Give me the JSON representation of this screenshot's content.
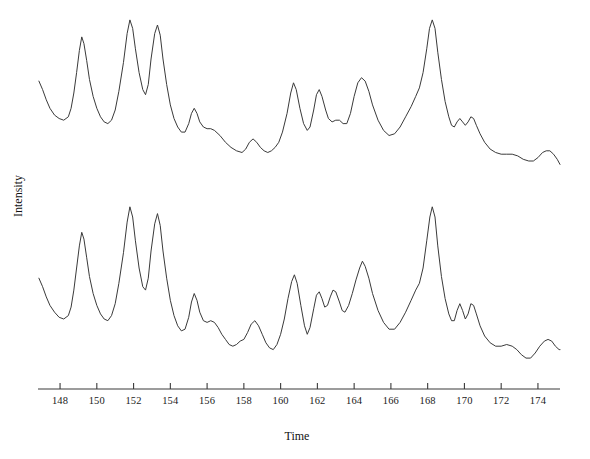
{
  "chart_data": {
    "type": "line",
    "title": "",
    "subtitle": "",
    "xlabel": "Time",
    "ylabel": "Intensity",
    "xlim": [
      146.8,
      175.2
    ],
    "ylim": [
      0,
      100
    ],
    "grid": false,
    "legend": "none",
    "x_ticks": [
      148,
      150,
      152,
      154,
      156,
      158,
      160,
      162,
      164,
      166,
      168,
      170,
      172,
      174
    ],
    "x_tick_labels": [
      "148",
      "150",
      "152",
      "154",
      "156",
      "158",
      "160",
      "162",
      "164",
      "166",
      "168",
      "170",
      "172",
      "174"
    ],
    "y_ticks": [],
    "y_tick_labels": [],
    "annotations": [],
    "series": [
      {
        "name": "upper-trace",
        "offset_label": "upper",
        "points": [
          [
            146.85,
            57
          ],
          [
            147.05,
            52
          ],
          [
            147.25,
            46
          ],
          [
            147.45,
            41
          ],
          [
            147.7,
            37
          ],
          [
            147.95,
            35
          ],
          [
            148.2,
            34
          ],
          [
            148.45,
            36
          ],
          [
            148.6,
            41
          ],
          [
            148.75,
            50
          ],
          [
            148.9,
            62
          ],
          [
            149.05,
            75
          ],
          [
            149.18,
            83
          ],
          [
            149.3,
            79
          ],
          [
            149.45,
            69
          ],
          [
            149.6,
            58
          ],
          [
            149.8,
            48
          ],
          [
            150.0,
            41
          ],
          [
            150.2,
            36
          ],
          [
            150.4,
            33
          ],
          [
            150.6,
            32
          ],
          [
            150.8,
            34
          ],
          [
            151.0,
            40
          ],
          [
            151.2,
            51
          ],
          [
            151.45,
            68
          ],
          [
            151.65,
            85
          ],
          [
            151.8,
            93
          ],
          [
            151.95,
            88
          ],
          [
            152.1,
            76
          ],
          [
            152.3,
            62
          ],
          [
            152.5,
            52
          ],
          [
            152.65,
            49
          ],
          [
            152.8,
            55
          ],
          [
            152.95,
            70
          ],
          [
            153.15,
            85
          ],
          [
            153.3,
            90
          ],
          [
            153.45,
            84
          ],
          [
            153.6,
            70
          ],
          [
            153.8,
            55
          ],
          [
            154.0,
            43
          ],
          [
            154.2,
            35
          ],
          [
            154.4,
            30
          ],
          [
            154.6,
            27
          ],
          [
            154.8,
            27
          ],
          [
            155.0,
            32
          ],
          [
            155.15,
            38
          ],
          [
            155.3,
            41
          ],
          [
            155.45,
            38
          ],
          [
            155.6,
            33
          ],
          [
            155.8,
            30
          ],
          [
            156.0,
            29
          ],
          [
            156.2,
            29
          ],
          [
            156.4,
            28
          ],
          [
            156.7,
            25
          ],
          [
            157.0,
            21
          ],
          [
            157.3,
            18
          ],
          [
            157.6,
            16
          ],
          [
            157.9,
            15
          ],
          [
            158.1,
            17
          ],
          [
            158.3,
            21
          ],
          [
            158.5,
            23
          ],
          [
            158.7,
            21
          ],
          [
            158.9,
            18
          ],
          [
            159.1,
            16
          ],
          [
            159.3,
            15
          ],
          [
            159.5,
            16
          ],
          [
            159.7,
            18
          ],
          [
            159.9,
            21
          ],
          [
            160.1,
            27
          ],
          [
            160.35,
            38
          ],
          [
            160.55,
            50
          ],
          [
            160.7,
            56
          ],
          [
            160.85,
            52
          ],
          [
            161.05,
            41
          ],
          [
            161.25,
            32
          ],
          [
            161.45,
            28
          ],
          [
            161.6,
            30
          ],
          [
            161.8,
            40
          ],
          [
            161.95,
            49
          ],
          [
            162.1,
            52
          ],
          [
            162.25,
            48
          ],
          [
            162.45,
            40
          ],
          [
            162.6,
            35
          ],
          [
            162.8,
            33
          ],
          [
            163.0,
            34
          ],
          [
            163.2,
            34
          ],
          [
            163.4,
            32
          ],
          [
            163.6,
            32
          ],
          [
            163.8,
            38
          ],
          [
            164.0,
            48
          ],
          [
            164.2,
            56
          ],
          [
            164.4,
            59
          ],
          [
            164.6,
            57
          ],
          [
            164.8,
            51
          ],
          [
            165.0,
            43
          ],
          [
            165.3,
            34
          ],
          [
            165.6,
            28
          ],
          [
            165.9,
            25
          ],
          [
            166.2,
            26
          ],
          [
            166.5,
            30
          ],
          [
            166.8,
            36
          ],
          [
            167.1,
            42
          ],
          [
            167.35,
            48
          ],
          [
            167.55,
            53
          ],
          [
            167.75,
            62
          ],
          [
            167.95,
            76
          ],
          [
            168.1,
            88
          ],
          [
            168.25,
            93
          ],
          [
            168.4,
            88
          ],
          [
            168.55,
            74
          ],
          [
            168.75,
            58
          ],
          [
            168.95,
            45
          ],
          [
            169.15,
            36
          ],
          [
            169.3,
            31
          ],
          [
            169.45,
            30
          ],
          [
            169.6,
            33
          ],
          [
            169.75,
            35
          ],
          [
            169.9,
            33
          ],
          [
            170.05,
            31
          ],
          [
            170.2,
            33
          ],
          [
            170.35,
            36
          ],
          [
            170.5,
            35
          ],
          [
            170.65,
            31
          ],
          [
            170.85,
            26
          ],
          [
            171.1,
            21
          ],
          [
            171.4,
            17
          ],
          [
            171.7,
            15
          ],
          [
            172.0,
            14
          ],
          [
            172.3,
            14
          ],
          [
            172.6,
            14
          ],
          [
            172.9,
            13
          ],
          [
            173.2,
            11
          ],
          [
            173.5,
            10
          ],
          [
            173.75,
            10
          ],
          [
            174.0,
            12
          ],
          [
            174.25,
            15
          ],
          [
            174.45,
            16
          ],
          [
            174.65,
            16
          ],
          [
            174.85,
            14
          ],
          [
            175.05,
            11
          ],
          [
            175.2,
            8
          ]
        ]
      },
      {
        "name": "lower-trace",
        "offset_label": "lower",
        "points": [
          [
            146.85,
            54
          ],
          [
            147.05,
            49
          ],
          [
            147.25,
            43
          ],
          [
            147.45,
            38
          ],
          [
            147.7,
            34
          ],
          [
            147.95,
            31
          ],
          [
            148.2,
            30
          ],
          [
            148.45,
            32
          ],
          [
            148.6,
            37
          ],
          [
            148.75,
            47
          ],
          [
            148.9,
            60
          ],
          [
            149.05,
            73
          ],
          [
            149.18,
            81
          ],
          [
            149.3,
            77
          ],
          [
            149.45,
            66
          ],
          [
            149.6,
            55
          ],
          [
            149.8,
            45
          ],
          [
            150.0,
            38
          ],
          [
            150.2,
            33
          ],
          [
            150.4,
            30
          ],
          [
            150.6,
            29
          ],
          [
            150.8,
            32
          ],
          [
            151.0,
            39
          ],
          [
            151.2,
            51
          ],
          [
            151.45,
            69
          ],
          [
            151.65,
            87
          ],
          [
            151.8,
            96
          ],
          [
            151.95,
            90
          ],
          [
            152.1,
            76
          ],
          [
            152.3,
            60
          ],
          [
            152.5,
            49
          ],
          [
            152.65,
            47
          ],
          [
            152.8,
            54
          ],
          [
            152.95,
            70
          ],
          [
            153.15,
            86
          ],
          [
            153.3,
            92
          ],
          [
            153.45,
            85
          ],
          [
            153.6,
            70
          ],
          [
            153.8,
            54
          ],
          [
            154.0,
            41
          ],
          [
            154.2,
            32
          ],
          [
            154.4,
            26
          ],
          [
            154.6,
            23
          ],
          [
            154.8,
            24
          ],
          [
            155.0,
            31
          ],
          [
            155.15,
            40
          ],
          [
            155.3,
            45
          ],
          [
            155.45,
            41
          ],
          [
            155.6,
            34
          ],
          [
            155.8,
            29
          ],
          [
            156.0,
            28
          ],
          [
            156.2,
            29
          ],
          [
            156.4,
            28
          ],
          [
            156.6,
            25
          ],
          [
            156.8,
            21
          ],
          [
            157.0,
            18
          ],
          [
            157.2,
            15
          ],
          [
            157.4,
            14
          ],
          [
            157.6,
            15
          ],
          [
            157.8,
            17
          ],
          [
            158.0,
            18
          ],
          [
            158.2,
            22
          ],
          [
            158.4,
            27
          ],
          [
            158.6,
            29
          ],
          [
            158.8,
            26
          ],
          [
            159.0,
            21
          ],
          [
            159.2,
            16
          ],
          [
            159.4,
            13
          ],
          [
            159.6,
            12
          ],
          [
            159.8,
            15
          ],
          [
            160.0,
            21
          ],
          [
            160.2,
            30
          ],
          [
            160.4,
            42
          ],
          [
            160.6,
            52
          ],
          [
            160.75,
            56
          ],
          [
            160.9,
            51
          ],
          [
            161.1,
            38
          ],
          [
            161.3,
            26
          ],
          [
            161.45,
            21
          ],
          [
            161.6,
            25
          ],
          [
            161.8,
            36
          ],
          [
            161.95,
            44
          ],
          [
            162.1,
            46
          ],
          [
            162.25,
            42
          ],
          [
            162.4,
            37
          ],
          [
            162.55,
            38
          ],
          [
            162.7,
            43
          ],
          [
            162.85,
            47
          ],
          [
            163.0,
            46
          ],
          [
            163.2,
            40
          ],
          [
            163.35,
            35
          ],
          [
            163.5,
            34
          ],
          [
            163.7,
            38
          ],
          [
            163.9,
            45
          ],
          [
            164.1,
            53
          ],
          [
            164.3,
            60
          ],
          [
            164.45,
            64
          ],
          [
            164.6,
            61
          ],
          [
            164.8,
            54
          ],
          [
            165.0,
            45
          ],
          [
            165.3,
            35
          ],
          [
            165.6,
            28
          ],
          [
            165.9,
            24
          ],
          [
            166.2,
            24
          ],
          [
            166.5,
            28
          ],
          [
            166.8,
            34
          ],
          [
            167.1,
            41
          ],
          [
            167.35,
            47
          ],
          [
            167.55,
            51
          ],
          [
            167.75,
            60
          ],
          [
            167.95,
            76
          ],
          [
            168.12,
            90
          ],
          [
            168.25,
            96
          ],
          [
            168.4,
            90
          ],
          [
            168.55,
            73
          ],
          [
            168.75,
            55
          ],
          [
            168.95,
            42
          ],
          [
            169.15,
            33
          ],
          [
            169.3,
            29
          ],
          [
            169.45,
            29
          ],
          [
            169.6,
            35
          ],
          [
            169.75,
            39
          ],
          [
            169.9,
            35
          ],
          [
            170.05,
            30
          ],
          [
            170.2,
            33
          ],
          [
            170.35,
            39
          ],
          [
            170.5,
            38
          ],
          [
            170.65,
            33
          ],
          [
            170.85,
            26
          ],
          [
            171.1,
            20
          ],
          [
            171.4,
            16
          ],
          [
            171.7,
            14
          ],
          [
            172.0,
            14
          ],
          [
            172.3,
            15
          ],
          [
            172.6,
            14
          ],
          [
            172.85,
            12
          ],
          [
            173.1,
            9
          ],
          [
            173.35,
            7
          ],
          [
            173.6,
            7
          ],
          [
            173.85,
            10
          ],
          [
            174.1,
            14
          ],
          [
            174.35,
            17
          ],
          [
            174.55,
            18
          ],
          [
            174.75,
            17
          ],
          [
            174.95,
            14
          ],
          [
            175.15,
            12
          ],
          [
            175.2,
            12
          ]
        ]
      }
    ]
  },
  "axes": {
    "x_axis_name": "time-axis",
    "y_axis_name": "intensity-axis"
  },
  "style": {
    "line_color": "#3a3a3a",
    "axis_color": "#3a3a3a",
    "background": "#ffffff",
    "text_color": "#111111"
  }
}
